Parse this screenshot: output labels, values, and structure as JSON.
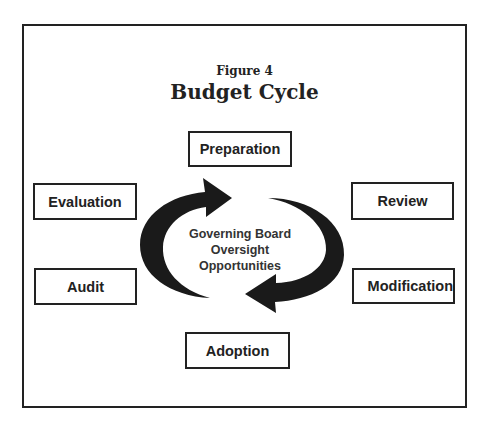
{
  "figure": {
    "number_label": "Figure 4",
    "title": "Budget Cycle"
  },
  "center": {
    "lines": [
      "Governing Board",
      "Oversight",
      "Opportunities"
    ]
  },
  "stages": {
    "preparation": "Preparation",
    "review": "Review",
    "modification": "Modification",
    "adoption": "Adoption",
    "audit": "Audit",
    "evaluation": "Evaluation"
  },
  "arrows": {
    "left": "clockwise-arrow-up",
    "right": "clockwise-arrow-down",
    "color": "#1a1a1a"
  },
  "colors": {
    "border": "#222222",
    "background": "#ffffff"
  }
}
